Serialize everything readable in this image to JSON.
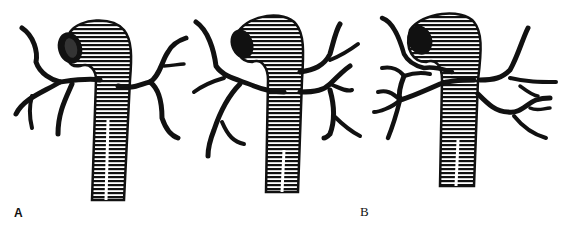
{
  "figure": {
    "ink_color": "#111111",
    "background": "#ffffff",
    "panels": [
      {
        "id": "A",
        "label": "A"
      },
      {
        "id": "B",
        "label": "B"
      },
      {
        "id": "C",
        "label": "C"
      }
    ]
  }
}
